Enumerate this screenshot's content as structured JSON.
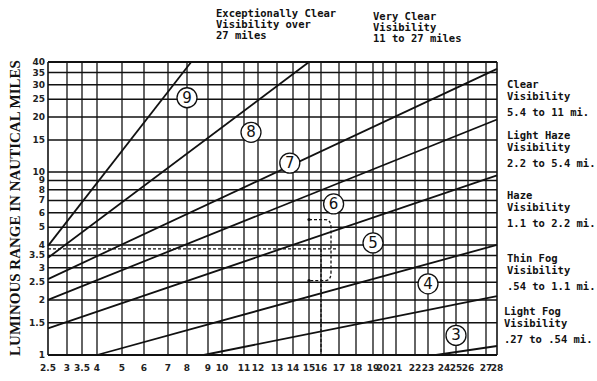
{
  "chart_data": {
    "type": "line",
    "title": "",
    "xlabel": "",
    "ylabel": "LUMINOUS RANGE IN NAUTICAL MILES",
    "xlim": [
      2.5,
      28
    ],
    "ylim": [
      1,
      40
    ],
    "xscale": "nonuniform",
    "yscale": "log",
    "grid": true,
    "x_ticks": [
      "2.5",
      "3",
      "3.5",
      "4",
      "5",
      "6",
      "7",
      "8",
      "9",
      "10",
      "11",
      "12",
      "13",
      "14",
      "15",
      "16",
      "17",
      "18",
      "19",
      "20",
      "21",
      "22",
      "23",
      "24",
      "25",
      "26",
      "27",
      "28"
    ],
    "x_tick_values": [
      2.5,
      3,
      3.5,
      4,
      5,
      6,
      7,
      8,
      9,
      10,
      11,
      12,
      13,
      14,
      15,
      16,
      17,
      18,
      19,
      20,
      21,
      22,
      23,
      24,
      25,
      26,
      27,
      28
    ],
    "y_ticks": [
      "1",
      "1.5",
      "2",
      "2.5",
      "3",
      "3.5",
      "4",
      "5",
      "6",
      "7",
      "8",
      "9",
      "10",
      "15",
      "20",
      "25",
      "30",
      "35",
      "40"
    ],
    "y_tick_values": [
      1,
      1.5,
      2,
      2.5,
      3,
      3.5,
      4,
      5,
      6,
      7,
      8,
      9,
      10,
      15,
      20,
      25,
      30,
      35,
      40
    ],
    "series": [
      {
        "name": "9",
        "label": "9",
        "points": [
          [
            2.5,
            3.95
          ],
          [
            8.2,
            40
          ]
        ]
      },
      {
        "name": "8",
        "label": "8",
        "points": [
          [
            2.5,
            3.4
          ],
          [
            15,
            40
          ]
        ]
      },
      {
        "name": "7",
        "label": "7",
        "points": [
          [
            2.5,
            2.6
          ],
          [
            28,
            36.7
          ]
        ]
      },
      {
        "name": "6",
        "label": "6",
        "points": [
          [
            2.5,
            2.0
          ],
          [
            28,
            19.4
          ]
        ]
      },
      {
        "name": "5",
        "label": "5",
        "points": [
          [
            2.5,
            1.4
          ],
          [
            28,
            9.6
          ]
        ]
      },
      {
        "name": "4",
        "label": "4",
        "points": [
          [
            4,
            1.0
          ],
          [
            28,
            4.0
          ]
        ]
      },
      {
        "name": "3",
        "label": "3",
        "points": [
          [
            8.8,
            1.0
          ],
          [
            28,
            2.1
          ]
        ]
      },
      {
        "name": "unlabeled",
        "label": "",
        "points": [
          [
            23.5,
            1.0
          ],
          [
            28,
            1.12
          ]
        ]
      }
    ],
    "curve_labels": [
      {
        "text": "9",
        "x": 8.0,
        "y": 25.5
      },
      {
        "text": "8",
        "x": 11.5,
        "y": 16.5
      },
      {
        "text": "7",
        "x": 13.8,
        "y": 11.2
      },
      {
        "text": "6",
        "x": 16.7,
        "y": 6.7
      },
      {
        "text": "5",
        "x": 19.0,
        "y": 4.1
      },
      {
        "text": "4",
        "x": 23.0,
        "y": 2.45
      },
      {
        "text": "3",
        "x": 25.0,
        "y": 1.28
      }
    ],
    "dashed_guides": {
      "horizontal_y": 3.8,
      "vertical_x": 16,
      "bracket": {
        "x_from": 15.0,
        "y_top": 5.5,
        "y_bottom": 2.55
      }
    },
    "annotations": [
      {
        "id": "exceptionally-clear",
        "lines": [
          "Exceptionally Clear",
          "Visibility over",
          "27 miles"
        ]
      },
      {
        "id": "very-clear",
        "lines": [
          "Very Clear",
          "Visibility",
          "11 to 27 miles"
        ]
      },
      {
        "id": "clear",
        "lines": [
          "Clear",
          "Visibility",
          "5.4 to 11 mi."
        ]
      },
      {
        "id": "light-haze",
        "lines": [
          "Light Haze",
          "Visibility",
          "2.2 to 5.4 mi."
        ]
      },
      {
        "id": "haze",
        "lines": [
          "Haze",
          "Visibility",
          "1.1 to 2.2 mi."
        ]
      },
      {
        "id": "thin-fog",
        "lines": [
          "Thin Fog",
          "Visibility",
          ".54 to 1.1 mi."
        ]
      },
      {
        "id": "light-fog",
        "lines": [
          "Light Fog",
          "Visibility",
          ".27 to .54 mi."
        ]
      }
    ]
  }
}
